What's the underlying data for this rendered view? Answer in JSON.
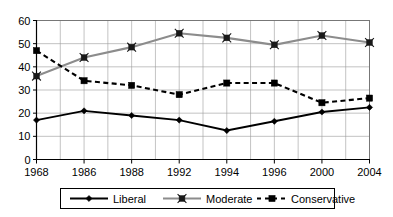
{
  "chart_data": {
    "type": "line",
    "title": "",
    "subtitle": "",
    "xlabel": "",
    "ylabel": "",
    "categories": [
      "1968",
      "1986",
      "1988",
      "1992",
      "1994",
      "1996",
      "2000",
      "2004"
    ],
    "ylim": [
      0,
      60
    ],
    "ytick_labels": [
      "0",
      "10",
      "20",
      "30",
      "40",
      "50",
      "60"
    ],
    "ytick_values": [
      0,
      10,
      20,
      30,
      40,
      50,
      60
    ],
    "grid": "horizontal-and-vertical",
    "legend_position": "bottom",
    "series": [
      {
        "name": "Liberal",
        "values": [
          17,
          21,
          19,
          17,
          12.5,
          16.5,
          20.5,
          22.5
        ],
        "color": "#000000",
        "line_style": "solid",
        "marker": "diamond"
      },
      {
        "name": "Moderate",
        "values": [
          36,
          44,
          48.5,
          54.5,
          52.5,
          49.5,
          53.5,
          50.5
        ],
        "color": "#8c8c8c",
        "line_style": "solid",
        "marker": "x-square"
      },
      {
        "name": "Conservative",
        "values": [
          47,
          34,
          32,
          28,
          33,
          33,
          24.5,
          26.5
        ],
        "color": "#000000",
        "line_style": "dashed",
        "marker": "square"
      }
    ]
  },
  "legend": {
    "items": [
      {
        "label": "Liberal"
      },
      {
        "label": "Moderate"
      },
      {
        "label": "Conservative"
      }
    ]
  }
}
